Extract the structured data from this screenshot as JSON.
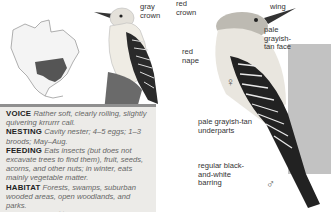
{
  "labels": {
    "gray_crown": "gray crown",
    "red_crown": "red crown",
    "at_base_of_outer_wing": "at base of outer wing",
    "pale_grayish_tan_face": "pale grayish-tan face",
    "red_nape": "red nape",
    "pale_grayish_tan_underparts": "pale grayish-tan underparts",
    "regular_barring": "regular black-and-white barring"
  },
  "symbols": {
    "female": "♀",
    "male": "♂"
  },
  "facts": [
    {
      "key": "VOICE",
      "value": "Rather soft, clearly rolling, slightly quivering krrurrr call."
    },
    {
      "key": "NESTING",
      "value": "Cavity nester; 4–5 eggs; 1–3 broods; May–Aug."
    },
    {
      "key": "FEEDING",
      "value": "Eats insects (but does not excavate trees to find them), fruit, seeds, acorns, and other nuts; in winter, eats mainly vegetable matter."
    },
    {
      "key": "HABITAT",
      "value": "Forests, swamps, suburban wooded areas, open woodlands, and parks."
    },
    {
      "key": "LENGTH",
      "value": "9–10½in (23–27cm)"
    },
    {
      "key": "WINGSPAN",
      "value": "16in (41cm)"
    }
  ],
  "colors": {
    "panel_bg": "#ecebe8",
    "panel_border": "#8f8f8f",
    "range_fill": "#555555"
  }
}
